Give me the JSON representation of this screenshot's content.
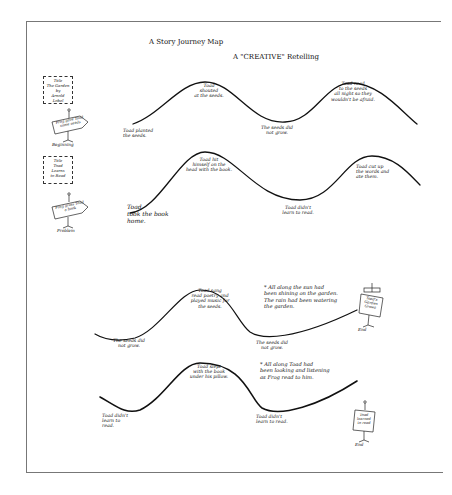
{
  "title": {
    "main": "A Story Journey Map",
    "subtitle": "A \"CREATIVE\" Retelling"
  },
  "left_panel": {
    "card1": "Title\nThe Garden\nby\nArnold Lobel",
    "sign1": "Frog gave Toad some seeds",
    "sign1_caption": "Beginning",
    "card2": "Title\nToad\nLearns\nto Read",
    "sign2": "Frog gives Toad a book",
    "sign2_caption": "Problem"
  },
  "rows": [
    {
      "id": "row-1",
      "labels": [
        "Toad planted\nthe seeds.",
        "Toad\nshouted\nat the seeds.",
        "The seeds did\nnot grow.",
        "Toad read\nto the seeds\nall night so they\nwouldn't be afraid."
      ]
    },
    {
      "id": "row-2",
      "labels": [
        "Toad\ntook the book\nhome.",
        "Toad hit\nhimself on the\nhead with the book.",
        "Toad didn't\nlearn to read.",
        "Toad cut up\nthe words and\nate them."
      ]
    },
    {
      "id": "row-3",
      "labels": [
        "The seeds did\nnot grow.",
        "Toad sang\nread poetry and\nplayed music for\nthe seeds.",
        "The seeds did\nnot grow."
      ],
      "note": "* All along the sun had\nbeen shining on the garden.\nThe rain had been watering\nthe garden.",
      "end_sign": "Toad's\nGarden\nGrows",
      "end_caption": "End"
    },
    {
      "id": "row-4",
      "labels": [
        "Toad didn't\nlearn to\nread.",
        "Toad slept\nwith the book\nunder his pillow.",
        "Toad didn't\nlearn to read."
      ],
      "note": "* All along Toad had\nbeen looking and listening\nas Frog read to him.",
      "end_sign": "Toad\nlearned\nto read",
      "end_caption": "End"
    }
  ],
  "colors": {
    "ink": "#111111",
    "frame": "#777777",
    "paper": "#ffffff"
  }
}
